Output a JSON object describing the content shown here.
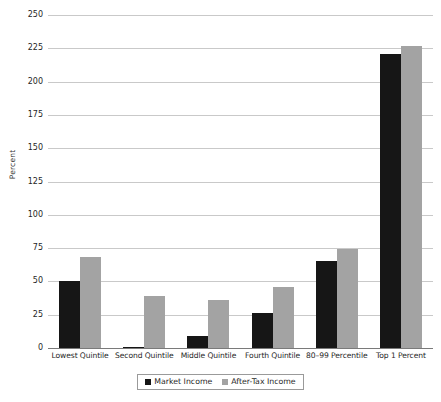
{
  "chart_data": {
    "type": "bar",
    "title": "",
    "xlabel": "",
    "ylabel": "Percent",
    "ylim": [
      0,
      250
    ],
    "ytick_step": 25,
    "yticks": [
      0,
      25,
      50,
      75,
      100,
      125,
      150,
      175,
      200,
      225,
      250
    ],
    "grid": true,
    "legend_position": "bottom",
    "categories": [
      "Lowest Quintile",
      "Second Quintile",
      "Middle Quintile",
      "Fourth Quintile",
      "80–99 Percentile",
      "Top 1 Percent"
    ],
    "series": [
      {
        "name": "Market Income",
        "color": "#161616",
        "values": [
          50,
          1,
          9,
          26,
          65,
          221
        ]
      },
      {
        "name": "After-Tax Income",
        "color": "#a3a3a3",
        "values": [
          68,
          39,
          36,
          46,
          74,
          227
        ]
      }
    ]
  },
  "axis": {
    "y_title": "Percent"
  },
  "colors": {
    "market_income": "#161616",
    "after_tax_income": "#a3a3a3",
    "gridline": "#c9c9c9",
    "baseline": "#7a7a7a",
    "background": "#ffffff"
  }
}
